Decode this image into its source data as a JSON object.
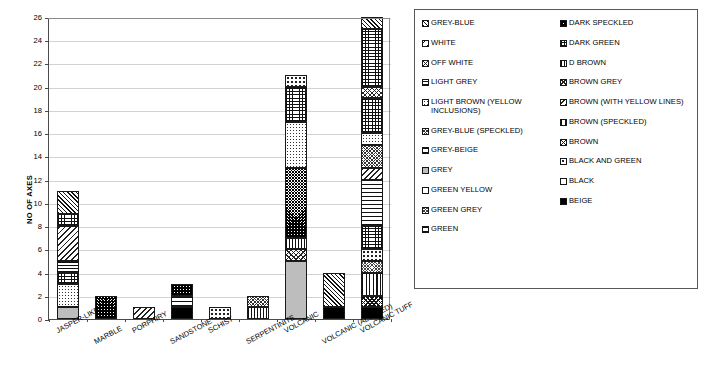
{
  "chart_data": {
    "type": "bar",
    "stacked": true,
    "title": "",
    "xlabel": "",
    "ylabel": "NO OF AXES",
    "ylim": [
      0,
      26
    ],
    "ytick_step": 2,
    "yticks": [
      0,
      2,
      4,
      6,
      8,
      10,
      12,
      14,
      16,
      18,
      20,
      22,
      24,
      26
    ],
    "grid": true,
    "legend_position": "right",
    "categories": [
      "JASPER-LIKE",
      "MARBLE",
      "PORPHIRY",
      "SANDSTONE",
      "SCHIST",
      "SERPENTINITE",
      "VOLCANIC",
      "VOLCANIC (ALTERED)",
      "VOLCANIC TUFF"
    ],
    "totals": [
      11,
      2,
      1,
      3,
      1,
      2,
      21,
      4,
      26
    ],
    "series": [
      {
        "name": "GREY-BLUE",
        "pattern": "p-grey-blue",
        "values": [
          1,
          0,
          0,
          0,
          0,
          0,
          0,
          0,
          1
        ]
      },
      {
        "name": "WHITE",
        "pattern": "p-white",
        "values": [
          0,
          0,
          0,
          0,
          0,
          0,
          0,
          0,
          3
        ]
      },
      {
        "name": "OFF WHITE",
        "pattern": "p-off-white",
        "values": [
          0,
          0,
          0,
          0,
          0,
          0,
          0,
          0,
          1
        ]
      },
      {
        "name": "LIGHT GREY",
        "pattern": "p-light-grey",
        "values": [
          1,
          0,
          0,
          0,
          0,
          0,
          0,
          0,
          1
        ]
      },
      {
        "name": "LIGHT BROWN (YELLOW INCLUSIONS)",
        "pattern": "p-light-brown-yellow",
        "values": [
          2,
          0,
          0,
          0,
          0,
          0,
          4,
          0,
          1
        ]
      },
      {
        "name": "GREY-BLUE (SPECKLED)",
        "pattern": "p-grey-blue-speckled",
        "values": [
          0,
          0,
          0,
          0,
          0,
          1,
          0,
          0,
          2
        ]
      },
      {
        "name": "GREY-BEIGE",
        "pattern": "p-grey-beige",
        "values": [
          1,
          0,
          0,
          1,
          0,
          0,
          0,
          0,
          4
        ]
      },
      {
        "name": "GREY",
        "pattern": "p-grey",
        "values": [
          1,
          0,
          0,
          0,
          0,
          0,
          5,
          0,
          0
        ]
      },
      {
        "name": "GREEN YELLOW",
        "pattern": "p-green-yellow",
        "values": [
          0,
          0,
          0,
          0,
          1,
          0,
          0,
          0,
          0
        ]
      },
      {
        "name": "GREEN GREY",
        "pattern": "p-green-grey",
        "values": [
          0,
          0,
          0,
          0,
          0,
          0,
          0,
          0,
          1
        ]
      },
      {
        "name": "GREEN",
        "pattern": "p-green",
        "values": [
          0,
          0,
          0,
          1,
          0,
          0,
          0,
          0,
          0
        ]
      },
      {
        "name": "DARK SPECKLED",
        "pattern": "p-dark-speckled",
        "values": [
          0,
          2,
          0,
          1,
          0,
          0,
          6,
          0,
          1
        ]
      },
      {
        "name": "DARK GREEN",
        "pattern": "p-dark-green",
        "values": [
          1,
          0,
          0,
          0,
          0,
          0,
          3,
          0,
          2
        ]
      },
      {
        "name": "D BROWN",
        "pattern": "p-d-brown",
        "values": [
          0,
          0,
          0,
          0,
          0,
          1,
          1,
          0,
          0
        ]
      },
      {
        "name": "BROWN GREY",
        "pattern": "p-brown-grey",
        "values": [
          0,
          0,
          1,
          0,
          0,
          0,
          0,
          3,
          0
        ]
      },
      {
        "name": "BROWN (WITH YELLOW LINES)",
        "pattern": "p-brown-yellow-lines",
        "values": [
          3,
          0,
          0,
          0,
          0,
          0,
          0,
          0,
          1
        ]
      },
      {
        "name": "BROWN (SPECKLED)",
        "pattern": "p-brown-speckled",
        "values": [
          0,
          0,
          0,
          0,
          0,
          0,
          0,
          0,
          4
        ]
      },
      {
        "name": "BROWN",
        "pattern": "p-brown",
        "values": [
          0,
          0,
          0,
          0,
          0,
          0,
          0,
          0,
          1
        ]
      },
      {
        "name": "BLACK AND GREEN",
        "pattern": "p-black-and-green",
        "values": [
          0,
          0,
          0,
          0,
          0,
          0,
          1,
          0,
          2
        ]
      },
      {
        "name": "BLACK",
        "pattern": "p-black",
        "values": [
          0,
          0,
          0,
          0,
          0,
          0,
          1,
          0,
          0
        ]
      },
      {
        "name": "BEIGE",
        "pattern": "p-beige",
        "values": [
          0,
          0,
          0,
          0,
          0,
          0,
          0,
          1,
          1
        ]
      }
    ],
    "bars": [
      {
        "category": "JASPER-LIKE",
        "total": 11,
        "segments": [
          {
            "name": "GREY",
            "pattern": "p-grey",
            "from": 0,
            "to": 1
          },
          {
            "name": "LIGHT BROWN (YELLOW INCLUSIONS)",
            "pattern": "p-light-brown-yellow",
            "from": 1,
            "to": 3
          },
          {
            "name": "DARK GREEN",
            "pattern": "p-dark-green",
            "from": 3,
            "to": 4
          },
          {
            "name": "LIGHT GREY",
            "pattern": "p-light-grey",
            "from": 4,
            "to": 5
          },
          {
            "name": "BROWN (WITH YELLOW LINES)",
            "pattern": "p-brown-yellow-lines",
            "from": 5,
            "to": 8
          },
          {
            "name": "GREY-BEIGE",
            "pattern": "p-dark-green",
            "from": 8,
            "to": 9
          },
          {
            "name": "GREY-BLUE",
            "pattern": "p-grey-blue",
            "from": 9,
            "to": 11
          }
        ]
      },
      {
        "category": "MARBLE",
        "total": 2,
        "segments": [
          {
            "name": "DARK SPECKLED",
            "pattern": "p-dark-speckled",
            "from": 0,
            "to": 2
          }
        ]
      },
      {
        "category": "PORPHIRY",
        "total": 1,
        "segments": [
          {
            "name": "BROWN GREY",
            "pattern": "p-brown-yellow-lines",
            "from": 0,
            "to": 1
          }
        ]
      },
      {
        "category": "SANDSTONE",
        "total": 3,
        "segments": [
          {
            "name": "BEIGE",
            "pattern": "p-beige",
            "from": 0,
            "to": 1
          },
          {
            "name": "GREY-BEIGE",
            "pattern": "p-grey-beige",
            "from": 1,
            "to": 2
          },
          {
            "name": "DARK SPECKLED",
            "pattern": "p-dark-speckled",
            "from": 2,
            "to": 3
          }
        ]
      },
      {
        "category": "SCHIST",
        "total": 1,
        "segments": [
          {
            "name": "BLACK AND GREEN",
            "pattern": "p-black-and-green",
            "from": 0,
            "to": 1
          }
        ]
      },
      {
        "category": "SERPENTINITE",
        "total": 2,
        "segments": [
          {
            "name": "D BROWN",
            "pattern": "p-d-brown",
            "from": 0,
            "to": 1
          },
          {
            "name": "GREY-BLUE (SPECKLED)",
            "pattern": "p-grey-blue-speckled",
            "from": 1,
            "to": 2
          }
        ]
      },
      {
        "category": "VOLCANIC",
        "total": 21,
        "segments": [
          {
            "name": "GREY",
            "pattern": "p-grey",
            "from": 0,
            "to": 5
          },
          {
            "name": "BLACK",
            "pattern": "p-brown-grey",
            "from": 5,
            "to": 6
          },
          {
            "name": "D BROWN",
            "pattern": "p-d-brown",
            "from": 6,
            "to": 7
          },
          {
            "name": "DARK SPECKLED",
            "pattern": "p-dark-speckled",
            "from": 7,
            "to": 13
          },
          {
            "name": "LIGHT BROWN (YELLOW INCLUSIONS)",
            "pattern": "p-light-brown-yellow",
            "from": 13,
            "to": 17
          },
          {
            "name": "DARK GREEN",
            "pattern": "p-dark-green",
            "from": 17,
            "to": 20
          },
          {
            "name": "BLACK AND GREEN",
            "pattern": "p-black-and-green",
            "from": 20,
            "to": 21
          }
        ]
      },
      {
        "category": "VOLCANIC (ALTERED)",
        "total": 4,
        "segments": [
          {
            "name": "BEIGE",
            "pattern": "p-beige",
            "from": 0,
            "to": 1
          },
          {
            "name": "BROWN GREY",
            "pattern": "p-grey-blue",
            "from": 1,
            "to": 4
          }
        ]
      },
      {
        "category": "VOLCANIC TUFF",
        "total": 26,
        "segments": [
          {
            "name": "BEIGE",
            "pattern": "p-beige",
            "from": 0,
            "to": 1
          },
          {
            "name": "BROWN",
            "pattern": "p-brown",
            "from": 1,
            "to": 2
          },
          {
            "name": "BROWN (SPECKLED)",
            "pattern": "p-brown-speckled",
            "from": 2,
            "to": 4
          },
          {
            "name": "GREEN GREY",
            "pattern": "p-green-grey",
            "from": 4,
            "to": 5
          },
          {
            "name": "BLACK AND GREEN",
            "pattern": "p-black-and-green",
            "from": 5,
            "to": 6
          },
          {
            "name": "DARK GREEN",
            "pattern": "p-dark-green",
            "from": 6,
            "to": 8
          },
          {
            "name": "GREY-BEIGE",
            "pattern": "p-grey-beige",
            "from": 8,
            "to": 12
          },
          {
            "name": "BROWN (WITH YELLOW LINES)",
            "pattern": "p-brown-yellow-lines",
            "from": 12,
            "to": 13
          },
          {
            "name": "GREY-BLUE (SPECKLED)",
            "pattern": "p-grey-blue-speckled",
            "from": 13,
            "to": 15
          },
          {
            "name": "LIGHT BROWN (YELLOW INCLUSIONS)",
            "pattern": "p-light-brown-yellow",
            "from": 15,
            "to": 16
          },
          {
            "name": "LIGHT GREY",
            "pattern": "p-dark-green",
            "from": 16,
            "to": 19
          },
          {
            "name": "OFF WHITE",
            "pattern": "p-off-white",
            "from": 19,
            "to": 20
          },
          {
            "name": "WHITE",
            "pattern": "p-brick",
            "from": 20,
            "to": 25
          },
          {
            "name": "GREY-BLUE",
            "pattern": "p-grey-blue",
            "from": 25,
            "to": 26
          }
        ]
      }
    ]
  },
  "legend": {
    "left_column": [
      {
        "label": "GREY-BLUE",
        "pattern": "p-grey-blue"
      },
      {
        "label": "WHITE",
        "pattern": "p-white"
      },
      {
        "label": "OFF WHITE",
        "pattern": "p-off-white"
      },
      {
        "label": "LIGHT GREY",
        "pattern": "p-light-grey"
      },
      {
        "label": "LIGHT BROWN (YELLOW INCLUSIONS)",
        "pattern": "p-light-brown-yellow"
      },
      {
        "label": "GREY-BLUE (SPECKLED)",
        "pattern": "p-grey-blue-speckled"
      },
      {
        "label": "GREY-BEIGE",
        "pattern": "p-grey-beige"
      },
      {
        "label": "GREY",
        "pattern": "p-grey"
      },
      {
        "label": "GREEN YELLOW",
        "pattern": "p-green-yellow"
      },
      {
        "label": "GREEN GREY",
        "pattern": "p-green-grey"
      },
      {
        "label": "GREEN",
        "pattern": "p-green"
      }
    ],
    "right_column": [
      {
        "label": "DARK SPECKLED",
        "pattern": "p-dark-speckled"
      },
      {
        "label": "DARK GREEN",
        "pattern": "p-dark-green"
      },
      {
        "label": "D BROWN",
        "pattern": "p-d-brown"
      },
      {
        "label": "BROWN GREY",
        "pattern": "p-brown-grey"
      },
      {
        "label": "BROWN (WITH YELLOW LINES)",
        "pattern": "p-brown-yellow-lines"
      },
      {
        "label": "BROWN (SPECKLED)",
        "pattern": "p-brown-speckled"
      },
      {
        "label": "BROWN",
        "pattern": "p-brown"
      },
      {
        "label": "BLACK AND GREEN",
        "pattern": "p-black-and-green"
      },
      {
        "label": "BLACK",
        "pattern": "p-black"
      },
      {
        "label": "BEIGE",
        "pattern": "p-beige"
      }
    ]
  }
}
